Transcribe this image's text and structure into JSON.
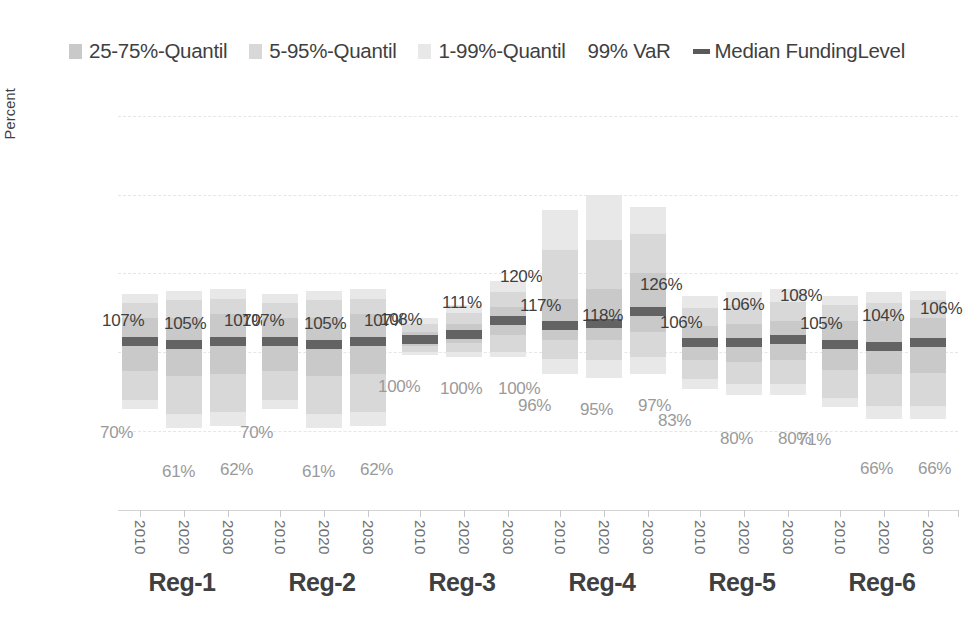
{
  "legend": {
    "items": [
      {
        "label": "25-75%-Quantil",
        "marker": "swatch",
        "color": "#c9c9c9",
        "name": "legend-swatch-25-75"
      },
      {
        "label": "5-95%-Quantil",
        "marker": "swatch",
        "color": "#d8d8d8",
        "name": "legend-swatch-5-95"
      },
      {
        "label": "1-99%-Quantil",
        "marker": "swatch",
        "color": "#e8e8e8",
        "name": "legend-swatch-1-99"
      },
      {
        "label": "99% VaR",
        "marker": "none",
        "color": "",
        "name": "legend-item-99-var"
      },
      {
        "label": "Median FundingLevel",
        "marker": "line",
        "color": "#5a5a5a",
        "name": "legend-line-median"
      }
    ]
  },
  "axes": {
    "y_title": "Percent",
    "y_ticks": [
      "0.0%",
      "50.0%",
      "100.0%",
      "150.0%",
      "200.0%",
      "250.0%"
    ],
    "y_tick_values": [
      0,
      50,
      100,
      150,
      200,
      250
    ],
    "x_tick_labels": [
      "2010",
      "2020",
      "2030"
    ],
    "group_labels": [
      "Reg-1",
      "Reg-2",
      "Reg-3",
      "Reg-4",
      "Reg-5",
      "Reg-6"
    ]
  },
  "chart_data": {
    "type": "bar",
    "title": "",
    "subtitle": "",
    "xlabel": "",
    "ylabel": "Percent",
    "ylim": [
      0,
      260
    ],
    "grid": true,
    "legend_position": "top-center",
    "categories": [
      "Reg-1",
      "Reg-2",
      "Reg-3",
      "Reg-4",
      "Reg-5",
      "Reg-6"
    ],
    "sub_categories": [
      "2010",
      "2020",
      "2030"
    ],
    "series_description": "Fan chart of funding level quantile bands per region and year; dark line marks the median funding level, upper data label is the median, lower data label is the 99% VaR.",
    "groups": [
      {
        "name": "Reg-1",
        "bars": [
          {
            "year": "2010",
            "q01": 64,
            "q05": 70,
            "q25": 88,
            "median": 107,
            "q75": 122,
            "q95": 131,
            "q99": 137,
            "median_label": "107%",
            "var_label": "70%"
          },
          {
            "year": "2020",
            "q01": 52,
            "q05": 61,
            "q25": 85,
            "median": 105,
            "q75": 122,
            "q95": 133,
            "q99": 139,
            "median_label": "105%",
            "var_label": "61%"
          },
          {
            "year": "2030",
            "q01": 53,
            "q05": 62,
            "q25": 86,
            "median": 107,
            "q75": 124,
            "q95": 134,
            "q99": 140,
            "median_label": "107%",
            "var_label": "62%"
          }
        ]
      },
      {
        "name": "Reg-2",
        "bars": [
          {
            "year": "2010",
            "q01": 64,
            "q05": 70,
            "q25": 88,
            "median": 107,
            "q75": 122,
            "q95": 131,
            "q99": 137,
            "median_label": "107%",
            "var_label": "70%"
          },
          {
            "year": "2020",
            "q01": 52,
            "q05": 61,
            "q25": 85,
            "median": 105,
            "q75": 122,
            "q95": 133,
            "q99": 139,
            "median_label": "105%",
            "var_label": "61%"
          },
          {
            "year": "2030",
            "q01": 53,
            "q05": 62,
            "q25": 86,
            "median": 107,
            "q75": 124,
            "q95": 134,
            "q99": 140,
            "median_label": "107%",
            "var_label": "62%"
          }
        ]
      },
      {
        "name": "Reg-3",
        "bars": [
          {
            "year": "2010",
            "q01": 98,
            "q05": 100,
            "q25": 104,
            "median": 108,
            "q75": 113,
            "q95": 118,
            "q99": 122,
            "median_label": "108%",
            "var_label": "100%"
          },
          {
            "year": "2020",
            "q01": 97,
            "q05": 100,
            "q25": 106,
            "median": 111,
            "q75": 118,
            "q95": 125,
            "q99": 130,
            "median_label": "111%",
            "var_label": "100%"
          },
          {
            "year": "2030",
            "q01": 97,
            "q05": 100,
            "q25": 111,
            "median": 120,
            "q75": 129,
            "q95": 138,
            "q99": 145,
            "median_label": "120%",
            "var_label": "100%"
          }
        ]
      },
      {
        "name": "Reg-4",
        "bars": [
          {
            "year": "2010",
            "q01": 86,
            "q05": 96,
            "q25": 108,
            "median": 117,
            "q75": 134,
            "q95": 165,
            "q99": 190,
            "median_label": "117%",
            "var_label": "96%"
          },
          {
            "year": "2020",
            "q01": 84,
            "q05": 95,
            "q25": 108,
            "median": 118,
            "q75": 140,
            "q95": 171,
            "q99": 200,
            "median_label": "118%",
            "var_label": "95%"
          },
          {
            "year": "2030",
            "q01": 86,
            "q05": 97,
            "q25": 113,
            "median": 126,
            "q75": 150,
            "q95": 175,
            "q99": 192,
            "median_label": "126%",
            "var_label": "97%"
          }
        ]
      },
      {
        "name": "Reg-5",
        "bars": [
          {
            "year": "2010",
            "q01": 77,
            "q05": 83,
            "q25": 95,
            "median": 106,
            "q75": 117,
            "q95": 128,
            "q99": 136,
            "median_label": "106%",
            "var_label": "83%"
          },
          {
            "year": "2020",
            "q01": 73,
            "q05": 80,
            "q25": 94,
            "median": 106,
            "q75": 118,
            "q95": 130,
            "q99": 138,
            "median_label": "106%",
            "var_label": "80%"
          },
          {
            "year": "2030",
            "q01": 73,
            "q05": 80,
            "q25": 95,
            "median": 108,
            "q75": 120,
            "q95": 132,
            "q99": 140,
            "median_label": "108%",
            "var_label": "80%"
          }
        ]
      },
      {
        "name": "Reg-6",
        "bars": [
          {
            "year": "2010",
            "q01": 65,
            "q05": 71,
            "q25": 89,
            "median": 105,
            "q75": 120,
            "q95": 130,
            "q99": 136,
            "median_label": "105%",
            "var_label": "71%"
          },
          {
            "year": "2020",
            "q01": 58,
            "q05": 66,
            "q25": 86,
            "median": 104,
            "q75": 120,
            "q95": 131,
            "q99": 138,
            "median_label": "104%",
            "var_label": "66%"
          },
          {
            "year": "2030",
            "q01": 58,
            "q05": 66,
            "q25": 87,
            "median": 106,
            "q75": 122,
            "q95": 133,
            "q99": 139,
            "median_label": "106%",
            "var_label": "66%"
          }
        ]
      }
    ]
  }
}
